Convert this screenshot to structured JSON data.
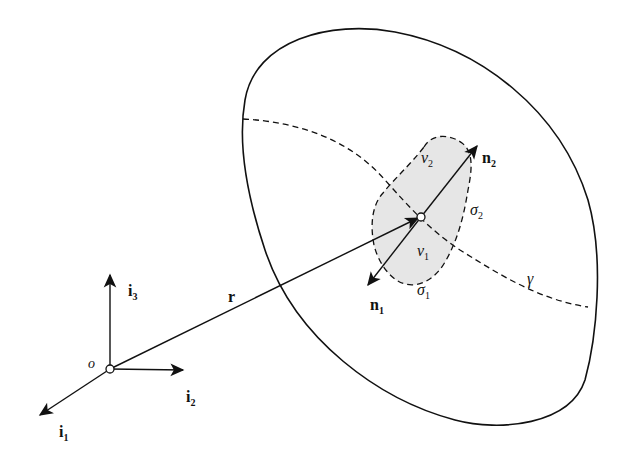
{
  "diagram": {
    "colors": {
      "stroke": "#111111",
      "shaded_region": "#e6e6e6",
      "background": "#ffffff"
    },
    "origin": {
      "label": "o"
    },
    "axes": [
      {
        "id": "i1",
        "label": "i",
        "subscript": "1"
      },
      {
        "id": "i2",
        "label": "i",
        "subscript": "2"
      },
      {
        "id": "i3",
        "label": "i",
        "subscript": "3"
      }
    ],
    "position_vector": {
      "label": "r"
    },
    "interface_curve": {
      "label": "γ"
    },
    "normals": [
      {
        "id": "n1",
        "label": "n",
        "subscript": "1"
      },
      {
        "id": "n2",
        "label": "n",
        "subscript": "2"
      }
    ],
    "subvolumes": [
      {
        "id": "v1",
        "label": "v",
        "subscript": "1"
      },
      {
        "id": "v2",
        "label": "v",
        "subscript": "2"
      }
    ],
    "surfaces": [
      {
        "id": "sigma1",
        "label": "σ",
        "subscript": "1"
      },
      {
        "id": "sigma2",
        "label": "σ",
        "subscript": "2"
      }
    ]
  }
}
